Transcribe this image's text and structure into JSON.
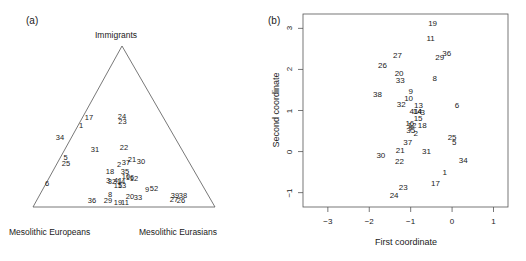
{
  "figure": {
    "panel_a_label": "(a)",
    "panel_b_label": "(b)"
  },
  "chart_data": [
    {
      "type": "scatter",
      "panel": "(a)",
      "plot_kind": "ternary",
      "title": "",
      "vertices": {
        "top": "Immigrants",
        "bottom_left": "Mesolithic Europeans",
        "bottom_right": "Mesolithic Eurasians"
      },
      "grid": false,
      "legend": "none",
      "point_label_style": "numeric-id",
      "points": [
        {
          "label": "17",
          "x": 89.0,
          "y": 118.0
        },
        {
          "label": "24",
          "x": 122.0,
          "y": 117.0
        },
        {
          "label": "23",
          "x": 122.5,
          "y": 122.0
        },
        {
          "label": "1",
          "x": 81.0,
          "y": 126.0
        },
        {
          "label": "34",
          "x": 60.0,
          "y": 138.0
        },
        {
          "label": "31",
          "x": 95.0,
          "y": 150.0
        },
        {
          "label": "22",
          "x": 124.0,
          "y": 148.0
        },
        {
          "label": "5",
          "x": 65.5,
          "y": 158.0
        },
        {
          "label": "25",
          "x": 66.0,
          "y": 163.5
        },
        {
          "label": "21",
          "x": 132.0,
          "y": 160.0
        },
        {
          "label": "30",
          "x": 141.0,
          "y": 162.0
        },
        {
          "label": "37",
          "x": 126.0,
          "y": 163.0
        },
        {
          "label": "2",
          "x": 119.0,
          "y": 165.0
        },
        {
          "label": "18",
          "x": 110.0,
          "y": 172.0
        },
        {
          "label": "35",
          "x": 125.0,
          "y": 171.5
        },
        {
          "label": "10",
          "x": 126.0,
          "y": 177.0
        },
        {
          "label": "16",
          "x": 130.0,
          "y": 177.5
        },
        {
          "label": "12",
          "x": 134.0,
          "y": 178.5
        },
        {
          "label": "3",
          "x": 108.0,
          "y": 181.0
        },
        {
          "label": "32",
          "x": 112.0,
          "y": 182.0
        },
        {
          "label": "41",
          "x": 118.0,
          "y": 181.0
        },
        {
          "label": "14",
          "x": 121.0,
          "y": 182.0
        },
        {
          "label": "13",
          "x": 122.0,
          "y": 186.0
        },
        {
          "label": "15",
          "x": 118.0,
          "y": 185.5
        },
        {
          "label": "6",
          "x": 47.0,
          "y": 184.0
        },
        {
          "label": "9",
          "x": 147.0,
          "y": 190.0
        },
        {
          "label": "8",
          "x": 110.0,
          "y": 195.0
        },
        {
          "label": "52",
          "x": 154.0,
          "y": 189.0
        },
        {
          "label": "39",
          "x": 175.0,
          "y": 196.0
        },
        {
          "label": "38",
          "x": 183.0,
          "y": 195.5
        },
        {
          "label": "27",
          "x": 174.0,
          "y": 200.0
        },
        {
          "label": "26",
          "x": 181.0,
          "y": 200.5
        },
        {
          "label": "36",
          "x": 92.0,
          "y": 201.0
        },
        {
          "label": "29",
          "x": 108.0,
          "y": 201.0
        },
        {
          "label": "19",
          "x": 118.0,
          "y": 203.0
        },
        {
          "label": "11",
          "x": 125.0,
          "y": 203.0
        },
        {
          "label": "20",
          "x": 130.0,
          "y": 197.0
        },
        {
          "label": "33",
          "x": 138.0,
          "y": 198.0
        }
      ]
    },
    {
      "type": "scatter",
      "panel": "(b)",
      "plot_kind": "cartesian",
      "title": "",
      "xlabel": "First coordinate",
      "ylabel": "Second coordinate",
      "xlim": [
        -3.6,
        1.35
      ],
      "ylim": [
        -1.35,
        3.35
      ],
      "xticks": [
        -3,
        -2,
        -1,
        0,
        1
      ],
      "xticklabels": [
        "−3",
        "−2",
        "−1",
        "0",
        "1"
      ],
      "yticks": [
        -1,
        0,
        1,
        2,
        3
      ],
      "yticklabels": [
        "−1",
        "0",
        "1",
        "2",
        "3"
      ],
      "grid": false,
      "legend": "none",
      "point_label_style": "numeric-id",
      "points": [
        {
          "label": "19",
          "x": -0.47,
          "y": 3.1
        },
        {
          "label": "11",
          "x": -0.52,
          "y": 2.75
        },
        {
          "label": "36",
          "x": -0.13,
          "y": 2.38
        },
        {
          "label": "29",
          "x": -0.3,
          "y": 2.27
        },
        {
          "label": "27",
          "x": -1.32,
          "y": 2.32
        },
        {
          "label": "26",
          "x": -1.68,
          "y": 2.08
        },
        {
          "label": "20",
          "x": -1.28,
          "y": 1.88
        },
        {
          "label": "8",
          "x": -0.42,
          "y": 1.77
        },
        {
          "label": "33",
          "x": -1.25,
          "y": 1.72
        },
        {
          "label": "9",
          "x": -1.0,
          "y": 1.45
        },
        {
          "label": "38",
          "x": -1.8,
          "y": 1.38
        },
        {
          "label": "10",
          "x": -1.05,
          "y": 1.28
        },
        {
          "label": "32",
          "x": -1.23,
          "y": 1.14
        },
        {
          "label": "13",
          "x": -0.81,
          "y": 1.12
        },
        {
          "label": "6",
          "x": 0.12,
          "y": 1.12
        },
        {
          "label": "41",
          "x": -0.92,
          "y": 0.96
        },
        {
          "label": "14",
          "x": -0.84,
          "y": 0.96
        },
        {
          "label": "4",
          "x": -0.78,
          "y": 0.96
        },
        {
          "label": "3",
          "x": -0.71,
          "y": 0.94
        },
        {
          "label": "15",
          "x": -0.82,
          "y": 0.8
        },
        {
          "label": "16",
          "x": -1.02,
          "y": 0.66
        },
        {
          "label": "12",
          "x": -0.97,
          "y": 0.62
        },
        {
          "label": "18",
          "x": -0.72,
          "y": 0.62
        },
        {
          "label": "7",
          "x": -1.0,
          "y": 0.55
        },
        {
          "label": "35",
          "x": -1.0,
          "y": 0.5
        },
        {
          "label": "2",
          "x": -0.88,
          "y": 0.43
        },
        {
          "label": "25",
          "x": 0.0,
          "y": 0.33
        },
        {
          "label": "5",
          "x": 0.05,
          "y": 0.22
        },
        {
          "label": "37",
          "x": -1.07,
          "y": 0.22
        },
        {
          "label": "21",
          "x": -1.25,
          "y": 0.01
        },
        {
          "label": "31",
          "x": -0.62,
          "y": 0.0
        },
        {
          "label": "30",
          "x": -1.72,
          "y": -0.1
        },
        {
          "label": "34",
          "x": 0.27,
          "y": -0.22
        },
        {
          "label": "22",
          "x": -1.27,
          "y": -0.26
        },
        {
          "label": "1",
          "x": -0.18,
          "y": -0.52
        },
        {
          "label": "17",
          "x": -0.4,
          "y": -0.78
        },
        {
          "label": "23",
          "x": -1.18,
          "y": -0.88
        },
        {
          "label": "24",
          "x": -1.4,
          "y": -1.08
        }
      ]
    }
  ]
}
